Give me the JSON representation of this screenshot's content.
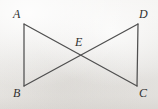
{
  "figure": {
    "name": "two-triangles-sharing-vertex-e",
    "background_color": "#f1f0ee",
    "line_color": "#4f4f4f",
    "label_color": "#2f2f2f",
    "vertices": [
      {
        "id": "A",
        "label": "A",
        "x": 24,
        "y": 24,
        "label_x": 13,
        "label_y": 8
      },
      {
        "id": "B",
        "label": "B",
        "x": 24,
        "y": 86,
        "label_x": 13,
        "label_y": 87
      },
      {
        "id": "C",
        "label": "C",
        "x": 137,
        "y": 86,
        "label_x": 139,
        "label_y": 87
      },
      {
        "id": "D",
        "label": "D",
        "x": 138,
        "y": 24,
        "label_x": 139,
        "label_y": 8
      },
      {
        "id": "E",
        "label": "E",
        "x": 80,
        "y": 55,
        "label_x": 75,
        "label_y": 36
      }
    ],
    "segments": [
      {
        "id": "AB",
        "from": "A",
        "to": "B",
        "x1": 24,
        "y1": 24,
        "x2": 24,
        "y2": 86
      },
      {
        "id": "DC",
        "from": "D",
        "to": "C",
        "x1": 138,
        "y1": 24,
        "x2": 137,
        "y2": 86
      },
      {
        "id": "AC",
        "from": "A",
        "to": "C",
        "x1": 24,
        "y1": 24,
        "x2": 137,
        "y2": 86
      },
      {
        "id": "BD",
        "from": "B",
        "to": "D",
        "x1": 24,
        "y1": 86,
        "x2": 138,
        "y2": 24
      }
    ]
  }
}
